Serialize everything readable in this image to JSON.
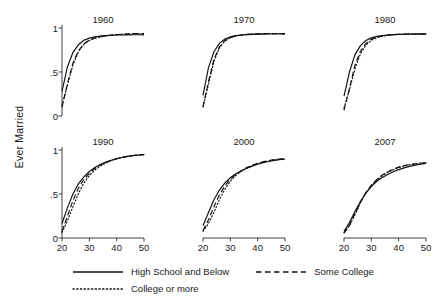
{
  "chart_data": {
    "type": "line",
    "title": "",
    "xlabel": "",
    "ylabel": "Ever Married",
    "xlim": [
      20,
      50
    ],
    "ylim": [
      0,
      1
    ],
    "xticks": [
      20,
      30,
      40,
      50
    ],
    "xtick_labels": [
      "20",
      "30",
      "40",
      "50"
    ],
    "yticks": [
      0,
      0.5,
      1
    ],
    "ytick_labels": [
      "0",
      ".5",
      "1"
    ],
    "grid": false,
    "legend_position": "bottom",
    "layout": "2 rows x 3 columns small multiples",
    "legend": [
      {
        "name": "High School and Below",
        "style": "solid"
      },
      {
        "name": "Some College",
        "style": "dashed"
      },
      {
        "name": "College or more",
        "style": "dotted"
      }
    ],
    "x": [
      20,
      22,
      24,
      26,
      28,
      30,
      32,
      34,
      36,
      38,
      40,
      42,
      44,
      46,
      48,
      50
    ],
    "panels": [
      {
        "title": "1960",
        "series": [
          {
            "name": "High School and Below",
            "style": "solid",
            "values": [
              0.28,
              0.56,
              0.72,
              0.81,
              0.86,
              0.885,
              0.9,
              0.908,
              0.913,
              0.917,
              0.92,
              0.921,
              0.922,
              0.923,
              0.923,
              0.922
            ]
          },
          {
            "name": "Some College",
            "style": "dashed",
            "values": [
              0.1,
              0.37,
              0.6,
              0.74,
              0.82,
              0.865,
              0.888,
              0.902,
              0.912,
              0.919,
              0.925,
              0.929,
              0.933,
              0.936,
              0.938,
              0.936
            ]
          },
          {
            "name": "College or more",
            "style": "dotted",
            "values": [
              0.12,
              0.35,
              0.58,
              0.73,
              0.815,
              0.858,
              0.882,
              0.898,
              0.909,
              0.917,
              0.923,
              0.928,
              0.931,
              0.934,
              0.935,
              0.933
            ]
          }
        ]
      },
      {
        "title": "1970",
        "series": [
          {
            "name": "High School and Below",
            "style": "solid",
            "values": [
              0.235,
              0.55,
              0.73,
              0.825,
              0.875,
              0.9,
              0.913,
              0.92,
              0.925,
              0.928,
              0.93,
              0.931,
              0.932,
              0.932,
              0.932,
              0.931
            ]
          },
          {
            "name": "Some College",
            "style": "dashed",
            "values": [
              0.105,
              0.39,
              0.645,
              0.785,
              0.858,
              0.893,
              0.911,
              0.921,
              0.927,
              0.931,
              0.934,
              0.936,
              0.937,
              0.938,
              0.938,
              0.937
            ]
          },
          {
            "name": "College or more",
            "style": "dotted",
            "values": [
              0.1,
              0.36,
              0.62,
              0.775,
              0.852,
              0.889,
              0.908,
              0.919,
              0.926,
              0.93,
              0.933,
              0.935,
              0.936,
              0.937,
              0.937,
              0.936
            ]
          }
        ]
      },
      {
        "title": "1980",
        "series": [
          {
            "name": "High School and Below",
            "style": "solid",
            "values": [
              0.225,
              0.5,
              0.695,
              0.8,
              0.858,
              0.888,
              0.905,
              0.915,
              0.921,
              0.925,
              0.927,
              0.929,
              0.93,
              0.931,
              0.931,
              0.93
            ]
          },
          {
            "name": "Some College",
            "style": "dashed",
            "values": [
              0.065,
              0.315,
              0.575,
              0.735,
              0.825,
              0.872,
              0.897,
              0.911,
              0.92,
              0.925,
              0.928,
              0.93,
              0.932,
              0.932,
              0.933,
              0.932
            ]
          },
          {
            "name": "College or more",
            "style": "dotted",
            "values": [
              0.09,
              0.3,
              0.535,
              0.705,
              0.805,
              0.86,
              0.889,
              0.906,
              0.916,
              0.922,
              0.926,
              0.929,
              0.931,
              0.932,
              0.933,
              0.932
            ]
          }
        ]
      },
      {
        "title": "1990",
        "series": [
          {
            "name": "High School and Below",
            "style": "solid",
            "values": [
              0.165,
              0.345,
              0.5,
              0.615,
              0.695,
              0.755,
              0.8,
              0.835,
              0.862,
              0.883,
              0.9,
              0.915,
              0.927,
              0.936,
              0.943,
              0.948
            ]
          },
          {
            "name": "Some College",
            "style": "dashed",
            "values": [
              0.075,
              0.25,
              0.425,
              0.565,
              0.665,
              0.735,
              0.79,
              0.83,
              0.86,
              0.883,
              0.902,
              0.917,
              0.928,
              0.937,
              0.944,
              0.949
            ]
          },
          {
            "name": "College or more",
            "style": "dotted",
            "values": [
              0.065,
              0.195,
              0.355,
              0.505,
              0.625,
              0.71,
              0.772,
              0.818,
              0.852,
              0.879,
              0.9,
              0.916,
              0.928,
              0.937,
              0.943,
              0.947
            ]
          }
        ]
      },
      {
        "title": "2000",
        "series": [
          {
            "name": "High School and Below",
            "style": "solid",
            "values": [
              0.14,
              0.29,
              0.435,
              0.545,
              0.625,
              0.685,
              0.73,
              0.765,
              0.793,
              0.817,
              0.838,
              0.855,
              0.87,
              0.882,
              0.891,
              0.898
            ]
          },
          {
            "name": "Some College",
            "style": "dashed",
            "values": [
              0.085,
              0.205,
              0.355,
              0.49,
              0.592,
              0.667,
              0.722,
              0.765,
              0.8,
              0.828,
              0.85,
              0.867,
              0.88,
              0.89,
              0.897,
              0.902
            ]
          },
          {
            "name": "College or more",
            "style": "dotted",
            "values": [
              0.075,
              0.165,
              0.29,
              0.435,
              0.555,
              0.645,
              0.71,
              0.757,
              0.793,
              0.822,
              0.845,
              0.863,
              0.876,
              0.886,
              0.893,
              0.898
            ]
          }
        ]
      },
      {
        "title": "2007",
        "series": [
          {
            "name": "High School and Below",
            "style": "solid",
            "values": [
              0.075,
              0.175,
              0.3,
              0.415,
              0.51,
              0.585,
              0.645,
              0.688,
              0.722,
              0.752,
              0.777,
              0.797,
              0.814,
              0.828,
              0.84,
              0.848
            ]
          },
          {
            "name": "Some College",
            "style": "dashed",
            "values": [
              0.055,
              0.145,
              0.275,
              0.405,
              0.515,
              0.6,
              0.665,
              0.715,
              0.752,
              0.782,
              0.805,
              0.822,
              0.834,
              0.843,
              0.85,
              0.855
            ]
          },
          {
            "name": "College or more",
            "style": "dotted",
            "values": [
              0.06,
              0.14,
              0.265,
              0.4,
              0.512,
              0.598,
              0.66,
              0.707,
              0.745,
              0.776,
              0.8,
              0.819,
              0.833,
              0.843,
              0.851,
              0.856
            ]
          }
        ]
      }
    ]
  }
}
